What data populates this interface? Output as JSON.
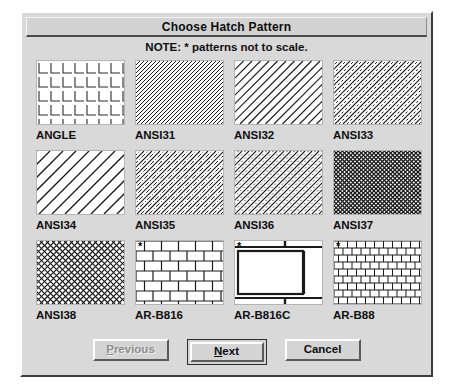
{
  "dialog": {
    "title": "Choose Hatch Pattern",
    "note": "NOTE: * patterns not to scale."
  },
  "patterns": [
    {
      "name": "ANGLE",
      "style": "angle",
      "starred": false
    },
    {
      "name": "ANSI31",
      "style": "ansi31",
      "starred": false
    },
    {
      "name": "ANSI32",
      "style": "ansi32",
      "starred": false
    },
    {
      "name": "ANSI33",
      "style": "ansi33",
      "starred": false
    },
    {
      "name": "ANSI34",
      "style": "ansi34",
      "starred": false
    },
    {
      "name": "ANSI35",
      "style": "ansi35",
      "starred": false
    },
    {
      "name": "ANSI36",
      "style": "ansi36",
      "starred": false
    },
    {
      "name": "ANSI37",
      "style": "ansi37",
      "starred": false
    },
    {
      "name": "ANSI38",
      "style": "ansi38",
      "starred": false
    },
    {
      "name": "AR-B816",
      "style": "brick816",
      "starred": true
    },
    {
      "name": "AR-B816C",
      "style": "brick816c",
      "starred": true
    },
    {
      "name": "AR-B88",
      "style": "brick88",
      "starred": true
    }
  ],
  "buttons": {
    "previous": {
      "label": "Previous",
      "mnemonic": "P",
      "disabled": true,
      "default": false
    },
    "next": {
      "label": "Next",
      "mnemonic": "N",
      "disabled": false,
      "default": true
    },
    "cancel": {
      "label": "Cancel",
      "mnemonic": "",
      "disabled": false,
      "default": false
    }
  },
  "star_glyph": "*",
  "colors": {
    "dialog_face": "#d9d9d9",
    "swatch_bg": "#ffffff",
    "text": "#101010",
    "disabled_text": "#8d8d8d",
    "border_dark": "#3b3b3b"
  }
}
